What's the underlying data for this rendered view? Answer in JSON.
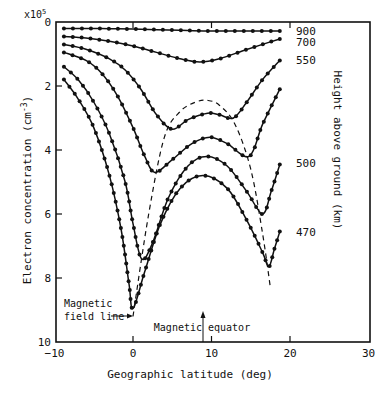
{
  "chart_data": {
    "type": "line",
    "title": "",
    "xlabel": "Geographic latitude (deg)",
    "ylabel": "Electron concentration (cm-3)",
    "ylabel_multiplier": "x10^5",
    "right_label": "Height above ground (km)",
    "xlim": [
      -10,
      30
    ],
    "ylim": [
      10,
      0
    ],
    "y_inverted": true,
    "x_ticks": [
      -10,
      0,
      10,
      20,
      30
    ],
    "y_ticks": [
      0,
      2,
      4,
      6,
      8,
      10
    ],
    "grid": false,
    "legend_position": "right, inline labels at curve ends",
    "series": [
      {
        "name": "900",
        "x": [
          -8.8,
          -6,
          -3,
          0,
          3,
          6,
          9,
          12,
          15,
          18.7
        ],
        "values": [
          0.2,
          0.2,
          0.21,
          0.22,
          0.24,
          0.26,
          0.28,
          0.28,
          0.28,
          0.28
        ]
      },
      {
        "name": "700",
        "x": [
          -8.8,
          -6,
          -3,
          0,
          3,
          6,
          8.5,
          11,
          14,
          16.5,
          18.7
        ],
        "values": [
          0.45,
          0.5,
          0.6,
          0.75,
          0.95,
          1.15,
          1.25,
          1.15,
          0.9,
          0.7,
          0.53
        ]
      },
      {
        "name": "550",
        "x": [
          -8.8,
          -6,
          -3,
          -1,
          1,
          3,
          5,
          7,
          9.5,
          11,
          12.8,
          14.5,
          16.5,
          18.7
        ],
        "values": [
          0.7,
          0.85,
          1.15,
          1.5,
          2.1,
          2.9,
          3.35,
          3.05,
          2.85,
          2.9,
          3.0,
          2.5,
          1.8,
          1.2
        ]
      },
      {
        "name": "Curve (unlabeled)",
        "x": [
          -8.8,
          -6,
          -4,
          -2,
          0,
          1.5,
          2.8,
          5,
          7.5,
          9.8,
          12,
          14.8,
          16.5,
          18.7
        ],
        "values": [
          0.95,
          1.2,
          1.6,
          2.3,
          3.3,
          4.2,
          4.7,
          4.3,
          3.8,
          3.6,
          3.8,
          4.2,
          3.2,
          2.1
        ]
      },
      {
        "name": "500",
        "x": [
          -8.8,
          -7,
          -5,
          -3,
          -1,
          0,
          1.1,
          2.5,
          4.5,
          7,
          9.4,
          12,
          14.5,
          16.5,
          17.6,
          18.7
        ],
        "values": [
          1.4,
          1.8,
          2.5,
          3.5,
          5.0,
          6.3,
          7.4,
          6.9,
          5.5,
          4.5,
          4.2,
          4.5,
          5.3,
          6.0,
          5.3,
          4.45
        ]
      },
      {
        "name": "470",
        "x": [
          -8.8,
          -7,
          -5,
          -3,
          -1.5,
          -0.5,
          0,
          1.5,
          3.5,
          6,
          8.9,
          12,
          14.5,
          16.5,
          17.3,
          18,
          18.7
        ],
        "values": [
          1.8,
          2.4,
          3.3,
          4.8,
          6.5,
          8.2,
          8.95,
          7.8,
          6.3,
          5.2,
          4.8,
          5.2,
          6.2,
          7.2,
          7.65,
          7.1,
          6.55
        ]
      }
    ],
    "dashed_line": {
      "name": "Magnetic field line",
      "x": [
        0,
        2,
        4,
        6,
        8,
        9.5,
        11,
        13,
        15,
        16.5,
        17.5
      ],
      "values": [
        9.2,
        6.0,
        3.6,
        2.8,
        2.5,
        2.45,
        2.6,
        3.2,
        4.6,
        6.6,
        8.3
      ]
    },
    "annotations": [
      {
        "text": "Magnetic field line",
        "x": 0,
        "y": 9.3,
        "arrow": "right"
      },
      {
        "text": "Magnetic equator",
        "x": 8.9,
        "y": 10,
        "arrow": "up"
      }
    ]
  },
  "labels": {
    "multiplier": "x10",
    "multiplier_exp": "5",
    "xlabel": "Geographic latitude (deg)",
    "ylabel": "Electron concentration (cm",
    "ylabel_exp": "-3",
    "ylabel_end": ")",
    "right_label": "Height above ground (km)",
    "annot_field_1": "Magnetic",
    "annot_field_2": "field line",
    "annot_equator": "Magnetic equator",
    "height_labels": [
      {
        "text": "900",
        "y": 0.28
      },
      {
        "text": "700",
        "y": 0.62
      },
      {
        "text": "550",
        "y": 1.2
      },
      {
        "text": "500",
        "y": 4.4
      },
      {
        "text": "470",
        "y": 6.55
      }
    ]
  }
}
